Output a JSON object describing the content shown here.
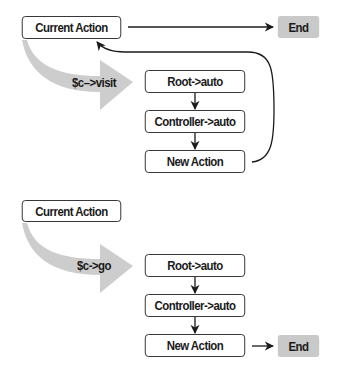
{
  "colors": {
    "box_border": "#2b2b2b",
    "box_fill": "#ffffff",
    "end_fill": "#c9c9c9",
    "flow_arrow_fill": "#cdcdcd",
    "line": "#1a1a1a"
  },
  "top_flow": {
    "current_action": "Current Action",
    "end": "End",
    "call_label": "$c–>visit",
    "steps": [
      "Root->auto",
      "Controller->auto",
      "New Action"
    ]
  },
  "bottom_flow": {
    "current_action": "Current Action",
    "end": "End",
    "call_label": "$c->go",
    "steps": [
      "Root->auto",
      "Controller->auto",
      "New Action"
    ]
  }
}
